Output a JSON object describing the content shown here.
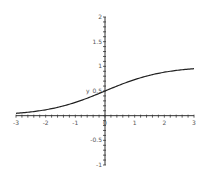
{
  "chart_data": {
    "type": "line",
    "title": "",
    "xlabel": "",
    "ylabel": "y",
    "xlim": [
      -3,
      3
    ],
    "ylim": [
      -1,
      2
    ],
    "grid": false,
    "legend": null,
    "x_ticks": [
      -3,
      -2,
      -1,
      0,
      1,
      2,
      3
    ],
    "x_tick_labels": [
      "-3",
      "-2",
      "-1",
      "0",
      "1",
      "2",
      "3"
    ],
    "y_ticks": [
      -1,
      -0.5,
      0.5,
      1,
      1.5,
      2
    ],
    "y_tick_labels": [
      "-1",
      "-0.5",
      "0.5",
      "1",
      "1.5",
      "2"
    ],
    "series": [
      {
        "name": "y",
        "x": [
          -3,
          -2.5,
          -2,
          -1.5,
          -1,
          -0.5,
          0,
          0.5,
          1,
          1.5,
          2,
          2.5,
          3
        ],
        "values": [
          0.047,
          0.076,
          0.119,
          0.182,
          0.269,
          0.378,
          0.5,
          0.622,
          0.731,
          0.818,
          0.881,
          0.924,
          0.953
        ],
        "color": "#222222"
      }
    ]
  }
}
